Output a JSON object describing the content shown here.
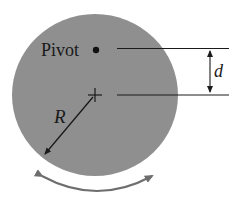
{
  "diagram": {
    "type": "physical-pendulum",
    "labels": {
      "pivot": "Pivot",
      "distance": "d",
      "radius": "R"
    },
    "colors": {
      "disk_fill": "#8f8f8f",
      "line": "#1a1a1a",
      "rotation_arrow": "#6e6e6e",
      "background": "#ffffff"
    },
    "elements": {
      "disk": "uniform solid disk",
      "pivot_point": "filled dot marking pivot",
      "center_mark": "plus sign at disk center",
      "radius_arrow": "arrow from center to rim labeled R",
      "distance_dimension": "vertical dimension arrow between pivot and center levels labeled d",
      "oscillation_arrow": "double-headed curved arrow below disk"
    }
  }
}
